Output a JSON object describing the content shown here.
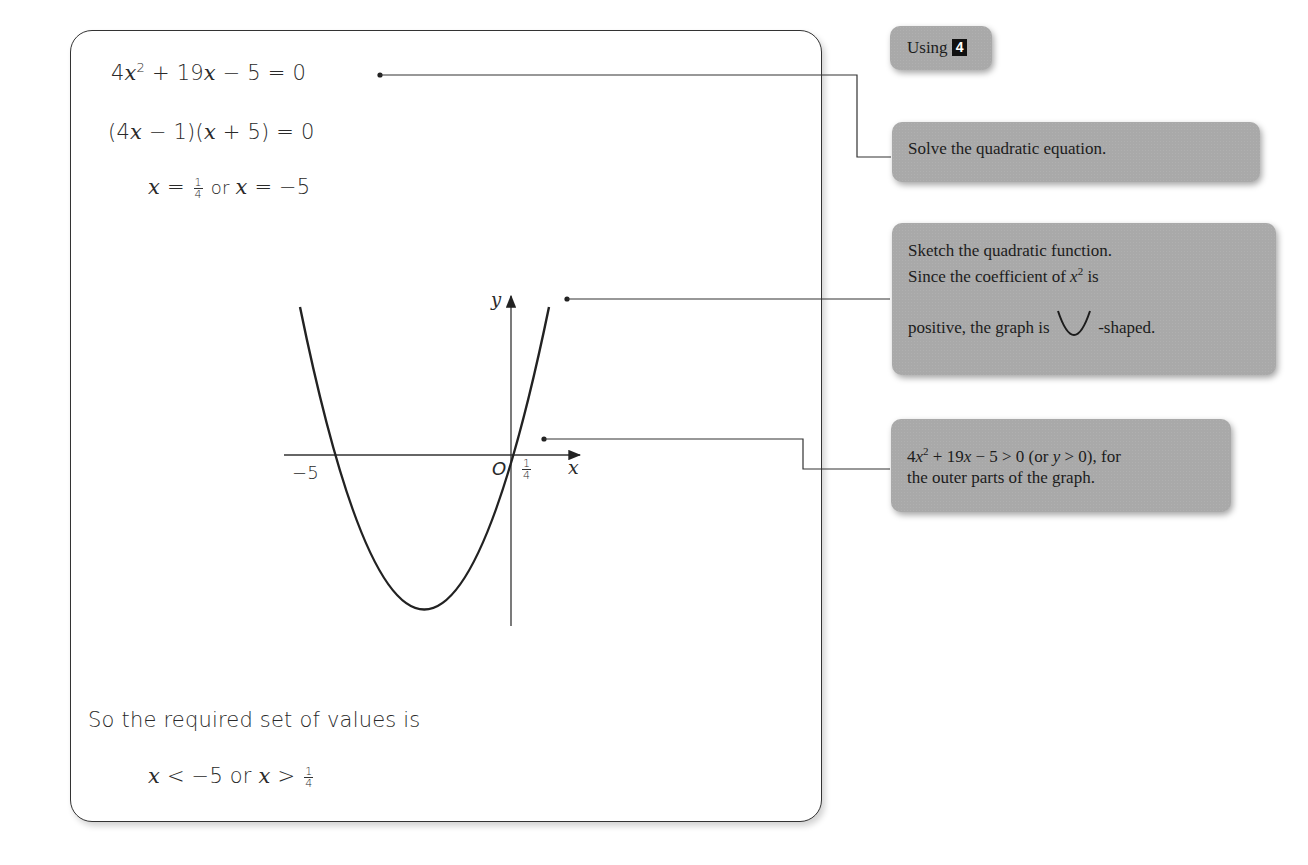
{
  "solution": {
    "line1": {
      "lhs_coef": "4",
      "var": "x",
      "exp": "2",
      "rest_plus": " + 19",
      "var2": "x",
      "rest": " − 5 = 0"
    },
    "line2": {
      "open": "(4",
      "var": "x",
      "mid": " − 1)(",
      "var2": "x",
      "close": " + 5) = 0"
    },
    "line3": {
      "var": "x",
      "eq": " = ",
      "frac_num": "1",
      "frac_den": "4",
      "or": " or ",
      "var2": "x",
      "rest": " = −5"
    },
    "conclusion_text": "So the required set of values is",
    "answer": {
      "var": "x",
      "lt": " < −5 or ",
      "var2": "x",
      "gt": " > ",
      "frac_num": "1",
      "frac_den": "4"
    }
  },
  "graph": {
    "y_label": "y",
    "x_label": "x",
    "origin_label": "O",
    "root_left_label": "−5",
    "root_right_num": "1",
    "root_right_den": "4"
  },
  "notes": [
    {
      "id": "using",
      "text": "Using",
      "badge": "4"
    },
    {
      "id": "solve",
      "text": "Solve the quadratic equation."
    },
    {
      "id": "sketch",
      "line1": "Sketch the quadratic function.",
      "line2a": "Since the coefficient of ",
      "line2_var": "x",
      "line2_exp": "2",
      "line2b": " is",
      "line3a": "positive, the graph is ",
      "line3b": " -shaped."
    },
    {
      "id": "inequality",
      "line1_coef": "4",
      "line1_var": "x",
      "line1_exp": "2",
      "line1_rest": " + 19",
      "line1_var2": "x",
      "line1_rest2": " − 5 > 0 (or ",
      "line1_var3": "y",
      "line1_rest3": " > 0), for",
      "line2": "the outer parts of the graph."
    }
  ],
  "colors": {
    "note_bg": "#a9a9a9",
    "ink": "#222222",
    "badge_bg": "#111111"
  }
}
